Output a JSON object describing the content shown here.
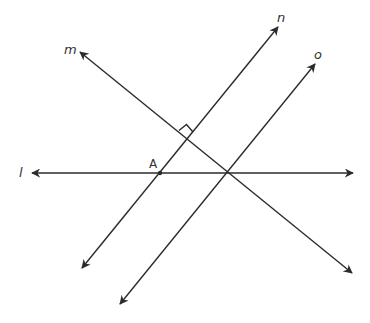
{
  "diagram": {
    "type": "geometry",
    "lines": [
      {
        "name": "l",
        "label": "l",
        "role": "horizontal transversal"
      },
      {
        "name": "m",
        "label": "m",
        "role": "perpendicular to n"
      },
      {
        "name": "n",
        "label": "n",
        "role": "parallel to o"
      },
      {
        "name": "o",
        "label": "o",
        "role": "parallel to n"
      }
    ],
    "points": [
      {
        "name": "A",
        "label": "A",
        "description": "intersection of l and n"
      }
    ],
    "markers": [
      {
        "type": "right-angle",
        "between": [
          "m",
          "n"
        ]
      }
    ],
    "colors": {
      "stroke": "#2b2b2b",
      "text": "#333333",
      "background": "#ffffff"
    }
  }
}
